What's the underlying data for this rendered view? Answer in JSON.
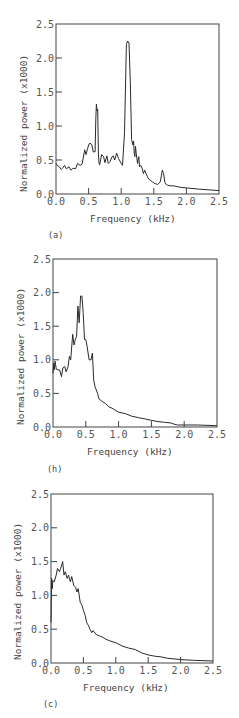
{
  "chart_data": [
    {
      "type": "line",
      "panel_label": "(a)",
      "xlabel": "Frequency (kHz)",
      "ylabel": "Normalized power (x1000)",
      "xlim": [
        0.0,
        2.5
      ],
      "ylim": [
        0.0,
        2.5
      ],
      "xticks": [
        "0.0",
        "0.5",
        "1.0",
        "1.5",
        "2.0",
        "2.5"
      ],
      "yticks": [
        "0.0",
        "0.5",
        "1.0",
        "1.5",
        "2.0",
        "2.5"
      ],
      "grid": false,
      "x": [
        0.0,
        0.02,
        0.05,
        0.08,
        0.1,
        0.13,
        0.16,
        0.2,
        0.23,
        0.26,
        0.3,
        0.33,
        0.37,
        0.4,
        0.44,
        0.46,
        0.48,
        0.5,
        0.52,
        0.55,
        0.57,
        0.6,
        0.61,
        0.62,
        0.63,
        0.64,
        0.65,
        0.66,
        0.67,
        0.7,
        0.73,
        0.75,
        0.78,
        0.8,
        0.83,
        0.86,
        0.88,
        0.9,
        0.93,
        0.96,
        1.0,
        1.02,
        1.05,
        1.08,
        1.1,
        1.12,
        1.14,
        1.16,
        1.18,
        1.19,
        1.2,
        1.21,
        1.22,
        1.23,
        1.25,
        1.27,
        1.28,
        1.3,
        1.32,
        1.34,
        1.36,
        1.38,
        1.4,
        1.42,
        1.45,
        1.48,
        1.5,
        1.53,
        1.56,
        1.6,
        1.63,
        1.65,
        1.67,
        1.69,
        1.71,
        1.75,
        1.8,
        1.9,
        2.0,
        2.2,
        2.5
      ],
      "values": [
        0.45,
        0.42,
        0.4,
        0.36,
        0.38,
        0.42,
        0.37,
        0.4,
        0.35,
        0.38,
        0.37,
        0.45,
        0.42,
        0.44,
        0.65,
        0.58,
        0.65,
        0.72,
        0.75,
        0.72,
        0.62,
        0.62,
        1.1,
        1.32,
        1.22,
        1.25,
        0.6,
        0.45,
        0.43,
        0.58,
        0.55,
        0.46,
        0.56,
        0.45,
        0.48,
        0.55,
        0.56,
        0.5,
        0.6,
        0.52,
        0.45,
        0.42,
        0.9,
        2.2,
        2.25,
        2.22,
        1.65,
        0.8,
        0.72,
        0.78,
        0.6,
        0.55,
        0.7,
        0.6,
        0.45,
        0.55,
        0.4,
        0.42,
        0.38,
        0.3,
        0.35,
        0.3,
        0.26,
        0.22,
        0.2,
        0.18,
        0.16,
        0.15,
        0.14,
        0.18,
        0.35,
        0.3,
        0.17,
        0.14,
        0.13,
        0.12,
        0.12,
        0.1,
        0.09,
        0.07,
        0.05
      ]
    },
    {
      "type": "line",
      "panel_label": "(h)",
      "xlabel": "Frequency (kHz)",
      "ylabel": "Normalized power (x1000)",
      "xlim": [
        0.0,
        2.5
      ],
      "ylim": [
        0.0,
        2.5
      ],
      "xticks": [
        "0.0",
        "0.5",
        "1.0",
        "1.5",
        "2.0",
        "2.5"
      ],
      "yticks": [
        "0.0",
        "0.5",
        "1.0",
        "1.5",
        "2.0",
        "2.5"
      ],
      "grid": false,
      "x": [
        0.0,
        0.01,
        0.02,
        0.03,
        0.05,
        0.08,
        0.1,
        0.13,
        0.15,
        0.18,
        0.2,
        0.23,
        0.25,
        0.27,
        0.3,
        0.32,
        0.34,
        0.36,
        0.38,
        0.4,
        0.42,
        0.44,
        0.46,
        0.48,
        0.5,
        0.52,
        0.55,
        0.58,
        0.6,
        0.62,
        0.64,
        0.66,
        0.68,
        0.7,
        0.75,
        0.8,
        0.85,
        0.9,
        1.0,
        1.1,
        1.2,
        1.3,
        1.4,
        1.5,
        1.6,
        1.7,
        1.8,
        1.85,
        1.9,
        2.0,
        2.2,
        2.5
      ],
      "values": [
        0.8,
        0.95,
        0.85,
        0.98,
        0.86,
        0.85,
        0.85,
        0.75,
        0.88,
        0.9,
        0.82,
        0.9,
        1.05,
        1.0,
        1.38,
        1.22,
        1.3,
        1.35,
        1.8,
        1.55,
        1.95,
        1.95,
        1.7,
        1.3,
        1.3,
        1.2,
        1.0,
        1.0,
        1.1,
        0.7,
        0.6,
        0.55,
        0.5,
        0.42,
        0.38,
        0.35,
        0.3,
        0.28,
        0.22,
        0.2,
        0.16,
        0.14,
        0.12,
        0.1,
        0.08,
        0.07,
        0.06,
        0.04,
        0.03,
        0.03,
        0.03,
        0.02
      ]
    },
    {
      "type": "line",
      "panel_label": "(c)",
      "xlabel": "Frequency (kHz)",
      "ylabel": "Normalized power (x1000)",
      "xlim": [
        0.0,
        2.5
      ],
      "ylim": [
        0.0,
        2.5
      ],
      "xticks": [
        "0.0",
        "0.5",
        "1.0",
        "1.5",
        "2.0",
        "2.5"
      ],
      "yticks": [
        "0.0",
        "0.5",
        "1.0",
        "1.5",
        "2.0",
        "2.5"
      ],
      "grid": false,
      "x": [
        0.0,
        0.01,
        0.02,
        0.03,
        0.05,
        0.08,
        0.1,
        0.13,
        0.15,
        0.18,
        0.2,
        0.22,
        0.25,
        0.27,
        0.3,
        0.32,
        0.35,
        0.38,
        0.4,
        0.42,
        0.45,
        0.48,
        0.5,
        0.53,
        0.55,
        0.58,
        0.6,
        0.63,
        0.65,
        0.7,
        0.75,
        0.8,
        0.85,
        0.9,
        1.0,
        1.1,
        1.2,
        1.3,
        1.4,
        1.5,
        1.6,
        1.7,
        1.8,
        1.9,
        2.0,
        2.2,
        2.5
      ],
      "values": [
        0.6,
        1.25,
        1.1,
        1.22,
        1.2,
        1.3,
        1.4,
        1.35,
        1.4,
        1.5,
        1.3,
        1.35,
        1.25,
        1.3,
        1.2,
        1.28,
        1.15,
        1.12,
        1.05,
        1.1,
        0.9,
        0.85,
        0.78,
        0.7,
        0.6,
        0.55,
        0.5,
        0.45,
        0.48,
        0.42,
        0.4,
        0.38,
        0.35,
        0.33,
        0.3,
        0.25,
        0.22,
        0.2,
        0.15,
        0.12,
        0.1,
        0.09,
        0.07,
        0.06,
        0.05,
        0.04,
        0.03
      ]
    }
  ],
  "panels": [
    {
      "label": "(a)",
      "xlabel": "Frequency (kHz)",
      "ylabel": "Normalized power (x1000)"
    },
    {
      "label": "(h)",
      "xlabel": "Frequency (kHz)",
      "ylabel": "Normalized power (x1000)"
    },
    {
      "label": "(c)",
      "xlabel": "Frequency (kHz)",
      "ylabel": "Normalized power (x1000)"
    }
  ]
}
